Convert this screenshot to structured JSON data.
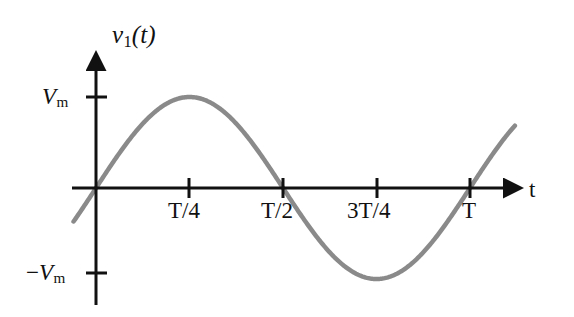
{
  "figure": {
    "background_color": "#ffffff",
    "axis_color": "#111111",
    "curve_color": "#8a8a8a"
  },
  "axes": {
    "y_title": "v1(t)",
    "y_title_parts": {
      "var": "v",
      "sub": "1",
      "arg": "(t)"
    },
    "x_title": "t",
    "y_ticks": [
      {
        "label": "Vm",
        "var": "V",
        "sub": "m",
        "sign": "",
        "value": 1
      },
      {
        "label": "-Vm",
        "var": "V",
        "sub": "m",
        "sign": "−",
        "value": -1
      }
    ],
    "x_ticks": [
      {
        "label": "T/4",
        "value": 0.25
      },
      {
        "label": "T/2",
        "value": 0.5
      },
      {
        "label": "3T/4",
        "value": 0.75
      },
      {
        "label": "T",
        "value": 1.0
      }
    ]
  },
  "chart_data": {
    "type": "line",
    "title": "",
    "subtitle": "",
    "xlabel": "t",
    "ylabel": "v1(t)",
    "xlim": [
      -0.06,
      1.12
    ],
    "ylim": [
      -1.25,
      1.45
    ],
    "grid": false,
    "legend": "none",
    "x_tick_labels": [
      "T/4",
      "T/2",
      "3T/4",
      "T"
    ],
    "x_tick_values": [
      0.25,
      0.5,
      0.75,
      1.0
    ],
    "y_tick_labels": [
      "Vm",
      "-Vm"
    ],
    "y_tick_values": [
      1,
      -1
    ],
    "series": [
      {
        "name": "v1(t)",
        "expression": "Vm*sin(2*pi*t/T)",
        "color": "#8a8a8a",
        "linewidth": 4.5,
        "x": [
          -0.06,
          0.0,
          0.0625,
          0.125,
          0.1875,
          0.25,
          0.3125,
          0.375,
          0.4375,
          0.5,
          0.5625,
          0.625,
          0.6875,
          0.75,
          0.8125,
          0.875,
          0.9375,
          1.0,
          1.06
        ],
        "y": [
          -0.368,
          0.0,
          0.383,
          0.707,
          0.924,
          1.0,
          0.924,
          0.707,
          0.383,
          0.0,
          -0.383,
          -0.707,
          -0.924,
          -1.0,
          -0.924,
          -0.707,
          -0.383,
          0.0,
          0.368
        ]
      }
    ],
    "annotations": []
  }
}
